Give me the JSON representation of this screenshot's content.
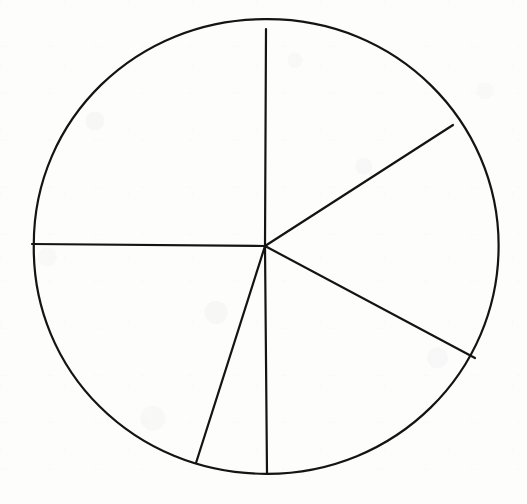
{
  "figure": {
    "kind": "hand-drawn-pie-diagram",
    "title": "",
    "background_color": "#fdfdfc",
    "ink_color": "#141414",
    "stroke_width": 2.2,
    "width": 527,
    "height": 504,
    "labels": [],
    "annotations": []
  },
  "chart_data": {
    "type": "pie",
    "title": "",
    "subtitle": "",
    "xlabel": "",
    "ylabel": "",
    "legend_position": "none",
    "grid": false,
    "data_labels_shown": false,
    "axis_labels_shown": false,
    "geometry": {
      "center_x": 265,
      "center_y": 246,
      "radius_x": 233,
      "radius_y": 227,
      "outline_closed": true,
      "slice_count": 6
    },
    "radial_line_angles_deg": [
      90,
      33,
      -28,
      -90,
      -107,
      180
    ],
    "radial_line_endpoints": [
      {
        "name": "top",
        "angle_deg": 90,
        "x": 266,
        "y": 29
      },
      {
        "name": "upper-right",
        "angle_deg": 33,
        "x": 453,
        "y": 125
      },
      {
        "name": "lower-right",
        "angle_deg": -28,
        "x": 475,
        "y": 358
      },
      {
        "name": "bottom",
        "angle_deg": -90,
        "x": 267,
        "y": 473
      },
      {
        "name": "bottom-left",
        "angle_deg": -107,
        "x": 196,
        "y": 463
      },
      {
        "name": "left",
        "angle_deg": 180,
        "x": 32,
        "y": 244
      }
    ],
    "categories": [
      "Slice 1",
      "Slice 2",
      "Slice 3",
      "Slice 4",
      "Slice 5",
      "Slice 6"
    ],
    "values": [
      57,
      61,
      62,
      17,
      73,
      90
    ],
    "value_unit": "degrees",
    "percentages": [
      15.8,
      16.9,
      17.2,
      4.7,
      20.3,
      25.0
    ],
    "slices": [
      {
        "label": "Slice 1",
        "start_angle_deg": 33,
        "end_angle_deg": 90,
        "sweep_deg": 57,
        "percent": 15.8,
        "fill": "none",
        "position": "upper-right-of-vertical"
      },
      {
        "label": "Slice 2",
        "start_angle_deg": -28,
        "end_angle_deg": 33,
        "sweep_deg": 61,
        "percent": 16.9,
        "fill": "none",
        "position": "right"
      },
      {
        "label": "Slice 3",
        "start_angle_deg": -90,
        "end_angle_deg": -28,
        "sweep_deg": 62,
        "percent": 17.2,
        "fill": "none",
        "position": "lower-right"
      },
      {
        "label": "Slice 4",
        "start_angle_deg": -107,
        "end_angle_deg": -90,
        "sweep_deg": 17,
        "percent": 4.7,
        "fill": "none",
        "position": "bottom-thin-wedge"
      },
      {
        "label": "Slice 5",
        "start_angle_deg": 180,
        "end_angle_deg": -107,
        "sweep_deg": 73,
        "percent": 20.3,
        "fill": "none",
        "position": "lower-left"
      },
      {
        "label": "Slice 6",
        "start_angle_deg": 90,
        "end_angle_deg": 180,
        "sweep_deg": 90,
        "percent": 25.0,
        "fill": "none",
        "position": "upper-left-quadrant"
      }
    ]
  }
}
